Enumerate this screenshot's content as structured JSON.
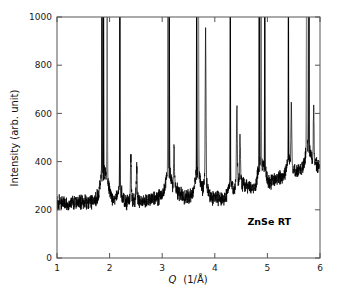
{
  "chart_data": {
    "type": "line",
    "title": "",
    "subtitle": "",
    "xlabel_q": "Q",
    "xlabel_units": "(1/Å)",
    "xlabel": "Q (1/Å)",
    "ylabel": "Intensity (arb. unit)",
    "xlim": [
      1,
      6
    ],
    "ylim": [
      0,
      1000
    ],
    "xticks": [
      1,
      2,
      3,
      4,
      5,
      6
    ],
    "xticklabels": [
      "1",
      "2",
      "3",
      "4",
      "5",
      "6"
    ],
    "yticks": [
      0,
      200,
      400,
      600,
      800,
      1000
    ],
    "yticklabels": [
      "0",
      "200",
      "400",
      "600",
      "800",
      "1000"
    ],
    "grid": false,
    "legend": null,
    "legend_position": "none",
    "line_color": "#000000",
    "background_color": "#ffffff",
    "frame_color": "#555555",
    "annotations": [
      {
        "text": "ZnSe RT",
        "x": 4.62,
        "y": 135,
        "name": "sample-label"
      }
    ],
    "series": [
      {
        "name": "ZnSe diffraction intensity",
        "color": "#000000",
        "description": "Powder/single-crystal X-ray diffraction scan: noisy background rising from ~220 to ~390 arb. units, with sharp Bragg reflections clipped at the 1000 top axis limit.",
        "baseline_points": [
          {
            "q": 1.0,
            "i": 228
          },
          {
            "q": 1.1,
            "i": 232
          },
          {
            "q": 1.2,
            "i": 224
          },
          {
            "q": 1.3,
            "i": 230
          },
          {
            "q": 1.4,
            "i": 226
          },
          {
            "q": 1.5,
            "i": 234
          },
          {
            "q": 1.6,
            "i": 228
          },
          {
            "q": 1.7,
            "i": 238
          },
          {
            "q": 1.78,
            "i": 250
          },
          {
            "q": 1.95,
            "i": 268
          },
          {
            "q": 2.1,
            "i": 238
          },
          {
            "q": 2.3,
            "i": 230
          },
          {
            "q": 2.5,
            "i": 232
          },
          {
            "q": 2.7,
            "i": 236
          },
          {
            "q": 2.9,
            "i": 248
          },
          {
            "q": 3.05,
            "i": 268
          },
          {
            "q": 3.25,
            "i": 280
          },
          {
            "q": 3.45,
            "i": 250
          },
          {
            "q": 3.6,
            "i": 262
          },
          {
            "q": 3.75,
            "i": 268
          },
          {
            "q": 3.95,
            "i": 250
          },
          {
            "q": 4.15,
            "i": 244
          },
          {
            "q": 4.3,
            "i": 258
          },
          {
            "q": 4.5,
            "i": 300
          },
          {
            "q": 4.7,
            "i": 288
          },
          {
            "q": 4.9,
            "i": 300
          },
          {
            "q": 5.1,
            "i": 318
          },
          {
            "q": 5.3,
            "i": 340
          },
          {
            "q": 5.5,
            "i": 352
          },
          {
            "q": 5.7,
            "i": 368
          },
          {
            "q": 5.85,
            "i": 382
          },
          {
            "q": 6.0,
            "i": 380
          }
        ],
        "peaks": [
          {
            "q": 1.855,
            "height": 1000,
            "clipped": true,
            "weight": "strong"
          },
          {
            "q": 1.885,
            "height": 1000,
            "clipped": true,
            "weight": "strong"
          },
          {
            "q": 1.955,
            "height": 1000,
            "clipped": true,
            "weight": "faint"
          },
          {
            "q": 2.195,
            "height": 1000,
            "clipped": true,
            "weight": "strong"
          },
          {
            "q": 2.405,
            "height": 405,
            "clipped": false,
            "weight": "strong"
          },
          {
            "q": 2.515,
            "height": 372,
            "clipped": false,
            "weight": "strong"
          },
          {
            "q": 3.11,
            "height": 1000,
            "clipped": true,
            "weight": "faint"
          },
          {
            "q": 3.135,
            "height": 1000,
            "clipped": true,
            "weight": "strong"
          },
          {
            "q": 3.225,
            "height": 400,
            "clipped": false,
            "weight": "strong"
          },
          {
            "q": 3.655,
            "height": 1000,
            "clipped": true,
            "weight": "strong"
          },
          {
            "q": 3.69,
            "height": 1000,
            "clipped": true,
            "weight": "faint"
          },
          {
            "q": 3.825,
            "height": 855,
            "clipped": false,
            "weight": "strong"
          },
          {
            "q": 4.295,
            "height": 1000,
            "clipped": true,
            "weight": "strong"
          },
          {
            "q": 4.42,
            "height": 560,
            "clipped": false,
            "weight": "strong"
          },
          {
            "q": 4.48,
            "height": 430,
            "clipped": false,
            "weight": "strong"
          },
          {
            "q": 4.845,
            "height": 1000,
            "clipped": true,
            "weight": "strong"
          },
          {
            "q": 4.88,
            "height": 1000,
            "clipped": true,
            "weight": "faint"
          },
          {
            "q": 4.95,
            "height": 1000,
            "clipped": true,
            "weight": "strong"
          },
          {
            "q": 5.4,
            "height": 1000,
            "clipped": true,
            "weight": "strong"
          },
          {
            "q": 5.455,
            "height": 497,
            "clipped": false,
            "weight": "strong"
          },
          {
            "q": 5.745,
            "height": 1000,
            "clipped": true,
            "weight": "faint"
          },
          {
            "q": 5.79,
            "height": 1000,
            "clipped": true,
            "weight": "strong"
          },
          {
            "q": 5.88,
            "height": 445,
            "clipped": false,
            "weight": "strong"
          }
        ]
      }
    ]
  }
}
